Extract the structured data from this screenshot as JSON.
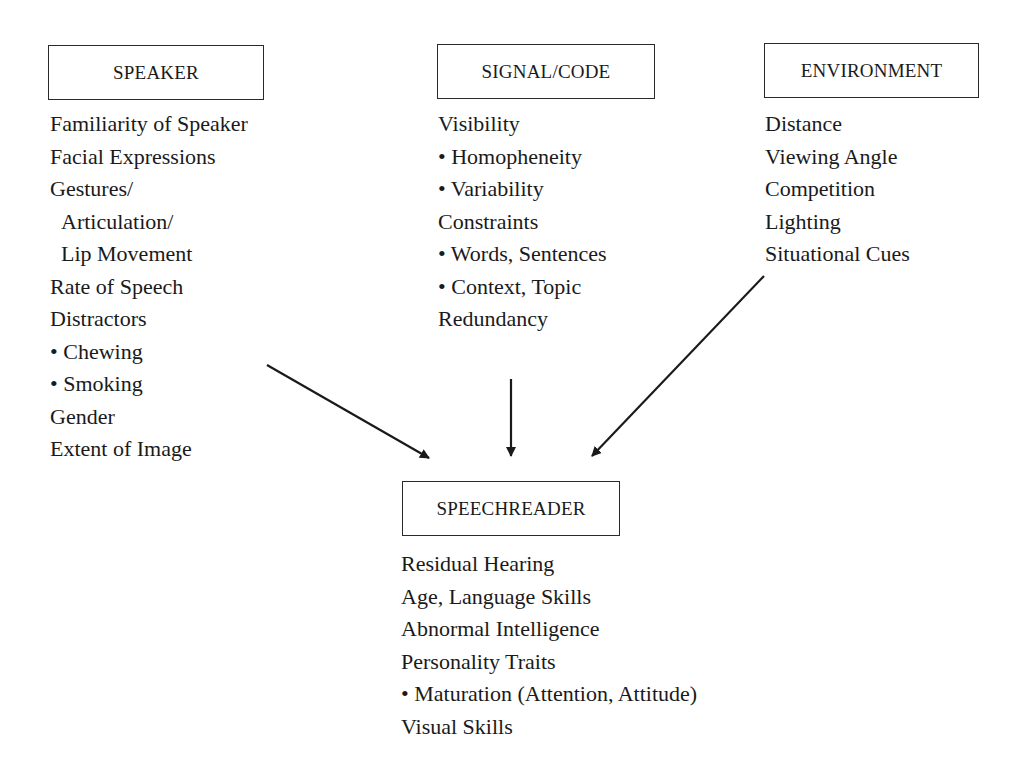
{
  "diagram": {
    "nodes": [
      {
        "id": "speaker",
        "title": "SPEAKER",
        "items": [
          "Familiarity of Speaker",
          "Facial Expressions",
          "Gestures/",
          "Articulation/",
          "Lip Movement",
          "Rate of Speech",
          "Distractors",
          "• Chewing",
          "• Smoking",
          "Gender",
          "Extent of Image"
        ]
      },
      {
        "id": "signal_code",
        "title": "SIGNAL/CODE",
        "items": [
          "Visibility",
          "• Homopheneity",
          "• Variability",
          "Constraints",
          "• Words, Sentences",
          "• Context, Topic",
          "Redundancy"
        ]
      },
      {
        "id": "environment",
        "title": "ENVIRONMENT",
        "items": [
          "Distance",
          "Viewing Angle",
          "Competition",
          "Lighting",
          "Situational Cues"
        ]
      },
      {
        "id": "speechreader",
        "title": "SPEECHREADER",
        "items": [
          "Residual Hearing",
          "Age, Language Skills",
          "Abnormal Intelligence",
          "Personality Traits",
          "• Maturation (Attention, Attitude)",
          "Visual Skills"
        ]
      }
    ],
    "edges": [
      {
        "from": "speaker",
        "to": "speechreader"
      },
      {
        "from": "signal_code",
        "to": "speechreader"
      },
      {
        "from": "environment",
        "to": "speechreader"
      }
    ],
    "colors": {
      "line": "#1a1a1a",
      "background": "#ffffff"
    }
  }
}
